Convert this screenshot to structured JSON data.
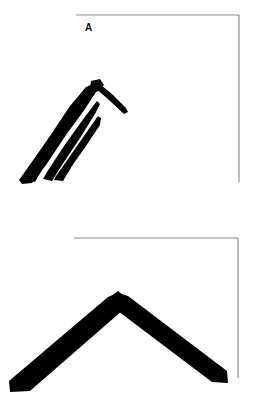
{
  "figure": {
    "background_color": "#ffffff",
    "ink_color": "#000000",
    "frame_color": "#8c8c8c",
    "width": 256,
    "height": 409,
    "panels": [
      {
        "id": "A",
        "label": "A",
        "label_x": 85,
        "label_y": 23,
        "description": "Multiple rough parallel brush strokes forming a ragged chevron with a thin tail",
        "frame": {
          "top_line": {
            "x1": 76,
            "y1": 15,
            "x2": 239,
            "y2": 15
          },
          "right_line": {
            "x1": 239,
            "y1": 15,
            "x2": 239,
            "y2": 182
          }
        },
        "strokes": [
          {
            "name": "stroke-1-outer-left",
            "points": "95,83 84,89 68,110 48,140 27,169 21,181 29,183 42,167 62,138 82,111 95,92",
            "weight": "thick"
          },
          {
            "name": "stroke-2",
            "points": "94,84 80,97 60,126 40,156 27,178 34,180 48,158 69,128 88,101 97,87",
            "weight": "medium"
          },
          {
            "name": "stroke-3",
            "points": "95,104 80,124 60,152 45,177 52,179 66,157 86,128 98,110",
            "weight": "medium"
          },
          {
            "name": "stroke-4",
            "points": "94,117 78,140 60,166 54,178 62,180 74,163 90,140 98,122",
            "weight": "thin"
          },
          {
            "name": "stroke-5-tail",
            "points": "97,82 110,94 124,107 127,110 125,113 110,100 96,88",
            "weight": "thin"
          }
        ]
      },
      {
        "id": "B",
        "label": "B",
        "label_x": 77,
        "label_y": 240,
        "description": "Single clean thick chevron (inverted V) brush stroke",
        "frame": {
          "top_line": {
            "x1": 74,
            "y1": 238,
            "x2": 238,
            "y2": 238
          },
          "right_line": {
            "x1": 238,
            "y1": 238,
            "x2": 238,
            "y2": 378
          }
        },
        "strokes": [
          {
            "name": "chevron-left-arm",
            "points": "118,294 128,301 25,390 10,391 10,382",
            "weight": "very-thick"
          },
          {
            "name": "chevron-right-arm",
            "points": "118,294 108,302 215,381 228,382 227,373",
            "weight": "very-thick"
          }
        ],
        "apex": {
          "x": 118,
          "y": 294
        },
        "left_tip": {
          "x": 10,
          "y": 390
        },
        "right_tip": {
          "x": 228,
          "y": 382
        }
      }
    ]
  }
}
